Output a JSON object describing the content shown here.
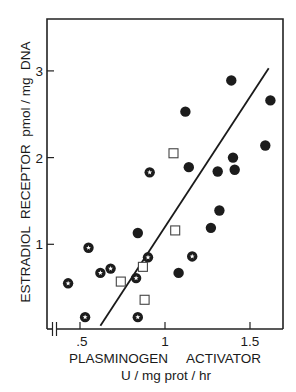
{
  "chart_data": {
    "type": "scatter",
    "title": "",
    "xlabel": "PLASMINOGEN     ACTIVATOR",
    "xlabel_units": "U / mg prot / hr",
    "ylabel": "ESTRADIOL  RECEPTOR  pmol / mg  DNA",
    "xlim": [
      0.3,
      1.7
    ],
    "ylim": [
      0,
      3.6
    ],
    "x_ticks": [
      0.5,
      1,
      1.5
    ],
    "x_tick_labels": [
      ".5",
      "1",
      "1.5"
    ],
    "y_ticks": [
      1,
      2,
      3
    ],
    "y_tick_labels": [
      "1",
      "2",
      "3"
    ],
    "x_axis_break": true,
    "grid": false,
    "legend": null,
    "series": [
      {
        "name": "filled circles",
        "marker": "filled-circle",
        "points": [
          {
            "x": 0.84,
            "y": 1.13
          },
          {
            "x": 1.08,
            "y": 0.67
          },
          {
            "x": 1.12,
            "y": 2.53
          },
          {
            "x": 1.14,
            "y": 1.89
          },
          {
            "x": 1.27,
            "y": 1.19
          },
          {
            "x": 1.31,
            "y": 1.84
          },
          {
            "x": 1.32,
            "y": 1.39
          },
          {
            "x": 1.39,
            "y": 2.89
          },
          {
            "x": 1.4,
            "y": 2.0
          },
          {
            "x": 1.41,
            "y": 1.86
          },
          {
            "x": 1.59,
            "y": 2.14
          },
          {
            "x": 1.62,
            "y": 2.66
          }
        ]
      },
      {
        "name": "circles with white star",
        "marker": "star-circle",
        "points": [
          {
            "x": 0.43,
            "y": 0.55
          },
          {
            "x": 0.53,
            "y": 0.16
          },
          {
            "x": 0.55,
            "y": 0.96
          },
          {
            "x": 0.62,
            "y": 0.67
          },
          {
            "x": 0.68,
            "y": 0.72
          },
          {
            "x": 0.83,
            "y": 0.61
          },
          {
            "x": 0.84,
            "y": 0.16
          },
          {
            "x": 0.9,
            "y": 0.85
          },
          {
            "x": 0.91,
            "y": 1.83
          },
          {
            "x": 1.16,
            "y": 0.86
          }
        ]
      },
      {
        "name": "open squares",
        "marker": "open-square",
        "points": [
          {
            "x": 0.74,
            "y": 0.57
          },
          {
            "x": 0.87,
            "y": 0.74
          },
          {
            "x": 0.88,
            "y": 0.36
          },
          {
            "x": 1.05,
            "y": 2.05
          },
          {
            "x": 1.06,
            "y": 1.16
          }
        ]
      }
    ],
    "regression_line": {
      "x1": 0.62,
      "y1": 0.06,
      "x2": 1.61,
      "y2": 3.03
    }
  }
}
